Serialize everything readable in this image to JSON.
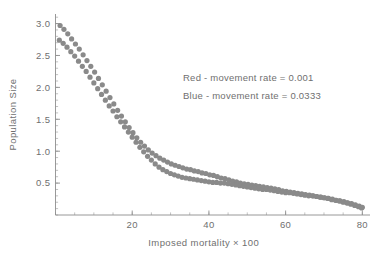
{
  "chart_data": {
    "type": "scatter",
    "title": "",
    "xlabel": "Imposed mortality × 100",
    "ylabel": "Population Size",
    "xlim": [
      0,
      82
    ],
    "ylim": [
      0,
      3.15
    ],
    "xticks": [
      20,
      40,
      60,
      80
    ],
    "yticks": [
      0.5,
      1.0,
      1.5,
      2.0,
      2.5,
      3.0
    ],
    "xtick_labels": [
      "20",
      "40",
      "60",
      "80"
    ],
    "ytick_labels": [
      "0.5",
      "1.0",
      "1.5",
      "2.0",
      "2.5",
      "3.0"
    ],
    "xtick_minor_step": 5,
    "ytick_minor_step": 0.1,
    "grid": false,
    "legend_position": "upper-center-right",
    "marker_color": "#8a8a8a",
    "marker_size": 2.6,
    "annotations": [
      "Red - movement rate = 0.001",
      "Blue - movement rate = 0.0333"
    ],
    "series": [
      {
        "name": "Red - movement rate = 0.001",
        "legend_label": "Red - movement rate = 0.001",
        "color": "#8a8a8a",
        "x": [
          1.2,
          2.2,
          3.2,
          4.2,
          5.2,
          6.2,
          7.2,
          8.2,
          9.2,
          10.2,
          11.2,
          12.2,
          13.2,
          14.2,
          15.2,
          16.2,
          17.2,
          18.2,
          19.2,
          20.2,
          21.2,
          22.2,
          23.2,
          24.2,
          25.2,
          26.2,
          27.2,
          28.2,
          29.2,
          30.2,
          31.2,
          32.2,
          33.2,
          34.2,
          35.2,
          36.2,
          37.2,
          38.2,
          39.2,
          40.2,
          41.2,
          42.2,
          43.2,
          44.2,
          45.2,
          46.2,
          47.2,
          48.2,
          49.2,
          50.2,
          51.2,
          52.2,
          53.2,
          54.2,
          55.2,
          56.2,
          57.2,
          58.2,
          59.2,
          60.2,
          61.2,
          62.2,
          63.2,
          64.2,
          65.2,
          66.2,
          67.2,
          68.2,
          69.2,
          70.2,
          71.2,
          72.2,
          73.2,
          74.2,
          75.2,
          76.2,
          77.2,
          78.2,
          79.2,
          80.0
        ],
        "y": [
          2.97,
          2.91,
          2.84,
          2.76,
          2.68,
          2.6,
          2.51,
          2.42,
          2.33,
          2.24,
          2.14,
          2.04,
          1.94,
          1.84,
          1.74,
          1.64,
          1.55,
          1.46,
          1.37,
          1.29,
          1.21,
          1.14,
          1.08,
          1.02,
          0.97,
          0.93,
          0.89,
          0.86,
          0.83,
          0.8,
          0.78,
          0.76,
          0.74,
          0.72,
          0.71,
          0.69,
          0.68,
          0.66,
          0.65,
          0.63,
          0.62,
          0.6,
          0.58,
          0.57,
          0.55,
          0.53,
          0.52,
          0.5,
          0.49,
          0.48,
          0.47,
          0.46,
          0.45,
          0.44,
          0.43,
          0.42,
          0.41,
          0.4,
          0.38,
          0.37,
          0.36,
          0.35,
          0.34,
          0.33,
          0.32,
          0.31,
          0.3,
          0.29,
          0.28,
          0.27,
          0.26,
          0.25,
          0.23,
          0.22,
          0.21,
          0.19,
          0.18,
          0.16,
          0.14,
          0.12
        ]
      },
      {
        "name": "Blue - movement rate = 0.0333",
        "legend_label": "Blue - movement rate = 0.0333",
        "color": "#8a8a8a",
        "x": [
          1.0,
          2.0,
          3.0,
          4.0,
          5.0,
          6.0,
          7.0,
          8.0,
          9.0,
          10.0,
          11.0,
          12.0,
          13.0,
          14.0,
          15.0,
          16.0,
          17.0,
          18.0,
          19.0,
          20.0,
          21.0,
          22.0,
          23.0,
          24.0,
          25.0,
          26.0,
          27.0,
          28.0,
          29.0,
          30.0,
          31.0,
          32.0,
          33.0,
          34.0,
          35.0,
          36.0,
          37.0,
          38.0,
          39.0,
          40.0,
          41.0,
          42.0,
          43.0,
          44.0,
          45.0,
          46.0,
          47.0,
          48.0,
          49.0,
          50.0,
          51.0,
          52.0,
          53.0,
          54.0,
          55.0,
          56.0,
          57.0,
          58.0,
          59.0,
          60.0,
          61.0,
          62.0,
          63.0,
          64.0,
          65.0,
          66.0,
          67.0,
          68.0,
          69.0,
          70.0,
          71.0,
          72.0,
          73.0,
          74.0,
          75.0,
          76.0,
          77.0,
          78.0,
          79.0,
          79.8
        ],
        "y": [
          2.74,
          2.69,
          2.63,
          2.56,
          2.49,
          2.41,
          2.33,
          2.25,
          2.16,
          2.07,
          1.98,
          1.89,
          1.8,
          1.71,
          1.63,
          1.54,
          1.46,
          1.38,
          1.3,
          1.22,
          1.14,
          1.06,
          0.99,
          0.92,
          0.86,
          0.8,
          0.75,
          0.71,
          0.68,
          0.65,
          0.63,
          0.61,
          0.59,
          0.58,
          0.57,
          0.56,
          0.55,
          0.54,
          0.53,
          0.52,
          0.51,
          0.51,
          0.5,
          0.5,
          0.49,
          0.48,
          0.47,
          0.46,
          0.45,
          0.44,
          0.43,
          0.42,
          0.41,
          0.4,
          0.4,
          0.39,
          0.38,
          0.37,
          0.36,
          0.35,
          0.35,
          0.34,
          0.33,
          0.32,
          0.31,
          0.3,
          0.3,
          0.29,
          0.28,
          0.27,
          0.26,
          0.24,
          0.23,
          0.22,
          0.2,
          0.19,
          0.17,
          0.15,
          0.13,
          0.11
        ]
      }
    ]
  }
}
